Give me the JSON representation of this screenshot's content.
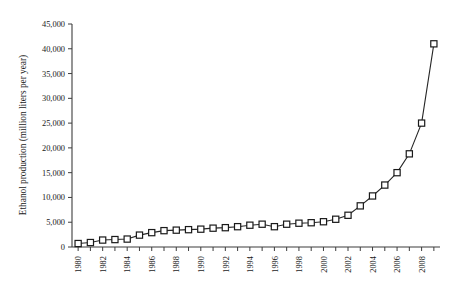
{
  "chart_data": {
    "type": "line",
    "title": "",
    "xlabel": "",
    "ylabel": "Ethanol production (million liters per year)",
    "xlim": [
      1979.5,
      2009.5
    ],
    "ylim": [
      0,
      45000
    ],
    "grid": false,
    "legend": "none",
    "marker": "open-square",
    "ytick_labels": [
      "0",
      "5,000",
      "10,000",
      "15,000",
      "20,000",
      "25,000",
      "30,000",
      "35,000",
      "40,000",
      "45,000"
    ],
    "ytick_values": [
      0,
      5000,
      10000,
      15000,
      20000,
      25000,
      30000,
      35000,
      40000,
      45000
    ],
    "xtick_labels": [
      "1980",
      "1982",
      "1984",
      "1986",
      "1988",
      "1990",
      "1992",
      "1994",
      "1996",
      "1998",
      "2000",
      "2002",
      "2004",
      "2006",
      "2008"
    ],
    "xtick_values": [
      1980,
      1982,
      1984,
      1986,
      1988,
      1990,
      1992,
      1994,
      1996,
      1998,
      2000,
      2002,
      2004,
      2006,
      2008
    ],
    "x": [
      1980,
      1981,
      1982,
      1983,
      1984,
      1985,
      1986,
      1987,
      1988,
      1989,
      1990,
      1991,
      1992,
      1993,
      1994,
      1995,
      1996,
      1997,
      1998,
      1999,
      2000,
      2001,
      2002,
      2003,
      2004,
      2005,
      2006,
      2007,
      2008,
      2009
    ],
    "values": [
      700,
      900,
      1400,
      1500,
      1600,
      2400,
      2900,
      3300,
      3400,
      3500,
      3600,
      3800,
      3900,
      4100,
      4400,
      4600,
      4100,
      4600,
      4800,
      4900,
      5100,
      5600,
      6400,
      8300,
      10300,
      12500,
      15000,
      18800,
      25000,
      34000
    ],
    "final_point_value": 41000,
    "final_point_year": 2009,
    "colors": {
      "axis": "#3d3d3d",
      "line": "#262626",
      "marker_fill": "#ffffff",
      "marker_stroke": "#1a1a1a",
      "background": "#ffffff"
    }
  }
}
